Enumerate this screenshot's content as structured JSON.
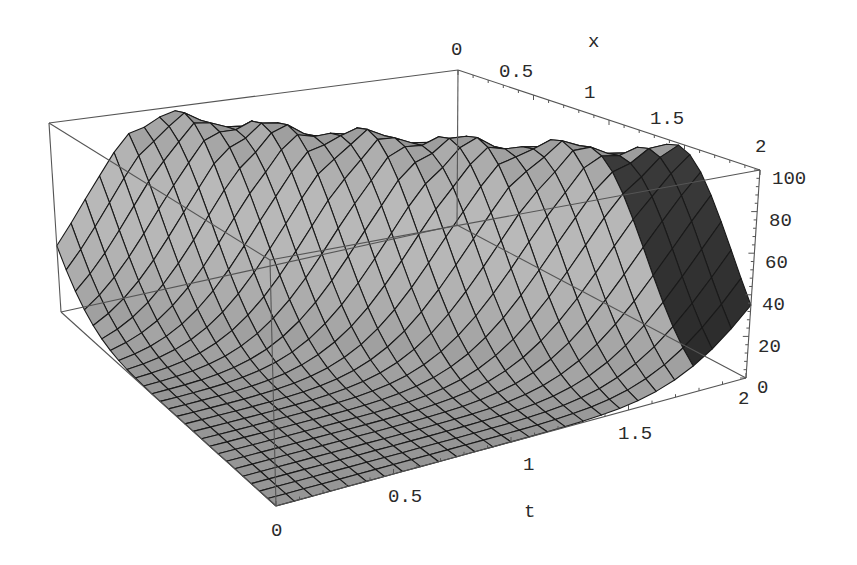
{
  "chart_data": {
    "type": "surface3d",
    "title": "",
    "x_axis": {
      "label": "x",
      "range": [
        0,
        2
      ],
      "ticks": [
        "0",
        "0.5",
        "1",
        "1.5",
        "2"
      ]
    },
    "t_axis": {
      "label": "t",
      "range": [
        0,
        2
      ],
      "ticks": [
        "0",
        "0.5",
        "1",
        "1.5",
        "2"
      ]
    },
    "z_axis": {
      "label": "",
      "range": [
        0,
        100
      ],
      "ticks": [
        "0",
        "20",
        "40",
        "60",
        "80",
        "100"
      ]
    },
    "surface_model": {
      "amplitude": 96,
      "center_at_t0": -0.55,
      "speed": 1.0,
      "width_sq": 0.3,
      "grid_cells": 26
    },
    "sample_values": [
      {
        "x": 0,
        "t": 0,
        "z": 35
      },
      {
        "x": 0,
        "t": 0.55,
        "z": 96
      },
      {
        "x": 1,
        "t": 1.55,
        "z": 96
      },
      {
        "x": 2,
        "t": 0,
        "z": 0
      },
      {
        "x": 2,
        "t": 1,
        "z": 1
      },
      {
        "x": 2,
        "t": 2,
        "z": 15
      },
      {
        "x": 1.45,
        "t": 2,
        "z": 96
      }
    ],
    "grid": false,
    "box": true
  },
  "labels": {
    "x_axis_title": "x",
    "t_axis_title": "t",
    "x_ticks": [
      "0",
      "0.5",
      "1",
      "1.5",
      "2"
    ],
    "t_ticks": [
      "0",
      "0.5",
      "1",
      "1.5",
      "2"
    ],
    "z_ticks": [
      "0",
      "20",
      "40",
      "60",
      "80",
      "100"
    ]
  }
}
